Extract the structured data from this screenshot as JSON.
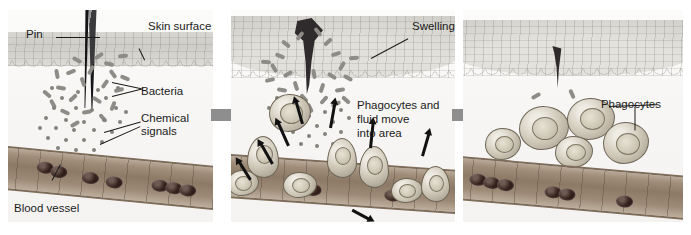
{
  "figure": {
    "type": "biology-diagram",
    "panel_count": 3
  },
  "panels": [
    {
      "id": "panel-1",
      "step": 1,
      "caption_labels": [
        {
          "name": "pin",
          "text": "Pin"
        },
        {
          "name": "skin-surface",
          "text": "Skin surface"
        },
        {
          "name": "bacteria",
          "text": "Bacteria"
        },
        {
          "name": "chemical-signals",
          "text": "Chemical\nsignals"
        },
        {
          "name": "blood-vessel",
          "text": "Blood vessel"
        }
      ]
    },
    {
      "id": "panel-2",
      "step": 2,
      "caption_labels": [
        {
          "name": "swelling",
          "text": "Swelling"
        },
        {
          "name": "phagocytes-move",
          "text": "Phagocytes and\nfluid move\ninto area"
        }
      ]
    },
    {
      "id": "panel-3",
      "step": 3,
      "caption_labels": [
        {
          "name": "phagocytes",
          "text": "Phagocytes"
        }
      ]
    }
  ],
  "labels": {
    "pin": "Pin",
    "skin_surface": "Skin surface",
    "bacteria": "Bacteria",
    "chemical_signals_line1": "Chemical",
    "chemical_signals_line2": "signals",
    "blood_vessel": "Blood vessel",
    "swelling": "Swelling",
    "phagocytes_move_line1": "Phagocytes and",
    "phagocytes_move_line2": "fluid move",
    "phagocytes_move_line3": "into area",
    "phagocytes": "Phagocytes"
  },
  "colors": {
    "background": "#ffffff",
    "panel_background": "#f2f1ef",
    "epidermis": "#d5d3ce",
    "dermis": "#f6f5f3",
    "vessel_wall": "#7d6c59",
    "vessel_lumen": "#8d7a66",
    "red_blood_cell": "#2a1a16",
    "bacteria": "#8e8c86",
    "chemical_signal": "#84827c",
    "phagocyte_fill": "#cfc8b8",
    "phagocyte_outline": "#6e6656",
    "pin": "#2c2c2e",
    "step_arrow": "#8e8e8e",
    "label_text": "#1b1b1b",
    "migration_arrow": "#111111"
  },
  "elements": {
    "bacteria_count_panel1": 22,
    "chemical_signal_count_panel1": 30,
    "red_blood_cells_panel1": 7,
    "bacteria_count_panel2": 26,
    "chemical_signal_count_panel2": 18,
    "phagocytes_panel2": 8,
    "migration_arrows_panel2": 8,
    "phagocytes_panel3": 5,
    "red_blood_cells_panel3": 6,
    "step_arrows": 2
  }
}
